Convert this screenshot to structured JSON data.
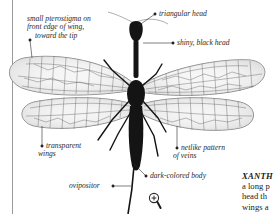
{
  "figure": {
    "labels": {
      "pterostigma": [
        "small pterostigma on",
        "front edge of wing,",
        "toward the tip"
      ],
      "triangular_head": "triangular head",
      "shiny_black_head": "shiny, black head",
      "transparent_wings": [
        "transparent",
        "wings"
      ],
      "netlike_veins": [
        "netlike pattern",
        "of veins"
      ],
      "ovipositor": "ovipositor",
      "dark_body": "dark-colored body"
    }
  },
  "caption": {
    "title_fragment": "XANTH",
    "lines": [
      "a long p",
      "head th",
      "wings a"
    ]
  },
  "controls": {
    "zoom_icon": "magnifier-plus-icon"
  },
  "colors": {
    "background": "#ffffff",
    "ink": "#1a1a1a",
    "wing_vein": "#5a5a5a",
    "margin_rule": "#9a9a9a"
  }
}
